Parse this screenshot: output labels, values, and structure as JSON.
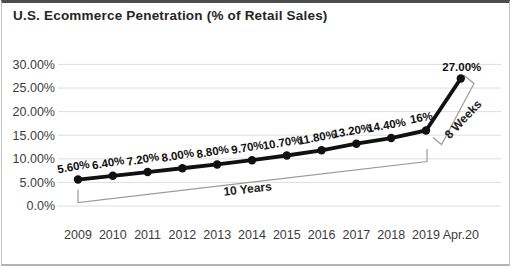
{
  "chart_data": {
    "type": "line",
    "title": "U.S. Ecommerce Penetration (% of Retail Sales)",
    "categories": [
      "2009",
      "2010",
      "2011",
      "2012",
      "2013",
      "2014",
      "2015",
      "2016",
      "2017",
      "2018",
      "2019",
      "Apr.20"
    ],
    "values": [
      5.6,
      6.4,
      7.2,
      8.0,
      8.8,
      9.7,
      10.7,
      11.8,
      13.2,
      14.4,
      16,
      27
    ],
    "point_labels": [
      "5.60%",
      "6.40%",
      "7.20%",
      "8.00%",
      "8.80%",
      "9.70%",
      "10.70%",
      "11.80%",
      "13.20%",
      "14.40%",
      "16%",
      "27.00%"
    ],
    "y_ticks": [
      {
        "label": "30.00%",
        "value": 30
      },
      {
        "label": "25.00%",
        "value": 25
      },
      {
        "label": "20.00%",
        "value": 20
      },
      {
        "label": "15.00%",
        "value": 15
      },
      {
        "label": "10.00%",
        "value": 10
      },
      {
        "label": "5.00%",
        "value": 5
      },
      {
        "label": "0.0%",
        "value": 0
      }
    ],
    "ylim": [
      0,
      30
    ],
    "xlabel": "",
    "ylabel": "",
    "grid": "horizontal",
    "legend": "none",
    "annotations": [
      {
        "text": "10 Years",
        "span": "2009 to 2019"
      },
      {
        "text": "8 Weeks",
        "span": "2019 to Apr.20"
      }
    ],
    "colors": {
      "line": "#111111",
      "grid": "#dedede",
      "bracket": "#9a9a9a",
      "axis_text": "#3c3c3c",
      "label_text": "#111111",
      "title_text": "#262626"
    }
  }
}
